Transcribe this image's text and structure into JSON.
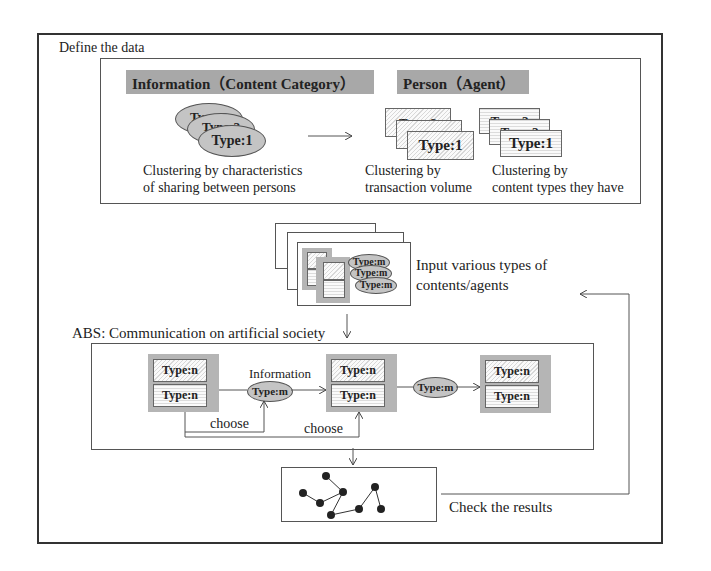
{
  "define": {
    "title": "Define the data",
    "information_header": "Information（Content Category）",
    "person_header": "Person（Agent）",
    "info_ellipses": [
      "Type:3",
      "Type:2",
      "Type:1"
    ],
    "info_caption_1": "Clustering by characteristics",
    "info_caption_2": "of sharing between persons",
    "volume_cards": [
      "Type:3",
      "Type:2",
      "Type:1"
    ],
    "volume_caption_1": "Clustering by",
    "volume_caption_2": "transaction volume",
    "content_cards": [
      "Type:3",
      "Type:2",
      "Type:1"
    ],
    "content_caption_1": "Clustering by",
    "content_caption_2": "content types they have"
  },
  "input": {
    "ellipses": [
      "Type:m",
      "Type:m",
      "Type:m"
    ],
    "caption_1": "Input various types of",
    "caption_2": "contents/agents"
  },
  "abs": {
    "title": "ABS: Communication on artificial society",
    "agents": [
      {
        "top": "Type:n",
        "bottom": "Type:n"
      },
      {
        "top": "Type:n",
        "bottom": "Type:n"
      },
      {
        "top": "Type:n",
        "bottom": "Type:n"
      }
    ],
    "info_label": "Information",
    "message_1": "Type:m",
    "message_2": "Type:m",
    "choose_1": "choose",
    "choose_2": "choose"
  },
  "results": {
    "caption": "Check the results"
  },
  "colors": {
    "header_fill": "#a8a8a8",
    "ellipse_fill": "#c4c4c4",
    "group_fill": "#b5b5b5",
    "line": "#555555"
  }
}
